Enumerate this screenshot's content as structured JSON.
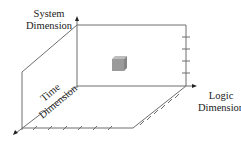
{
  "diagram": {
    "type": "3d-axes-schematic",
    "axes": {
      "system": {
        "line1": "System",
        "line2": "Dimension"
      },
      "logic": {
        "line1": "Logic",
        "line2": "Dimension"
      },
      "time": {
        "line1": "Time",
        "line2": "Dimension"
      }
    },
    "colors": {
      "line": "#6e6e6e",
      "cube_front": "#9a9a9a",
      "cube_top": "#bdbdbd",
      "cube_side": "#858585",
      "text": "#222222"
    }
  }
}
